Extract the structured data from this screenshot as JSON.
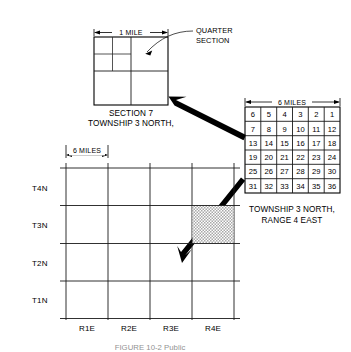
{
  "figure": {
    "caption": "FIGURE 10-2  Public"
  },
  "section_detail": {
    "dimension_label": "1 MILE",
    "caption_line1": "SECTION 7",
    "caption_line2": "TOWNSHIP 3 NORTH,",
    "callout_line1": "QUARTER",
    "callout_line2": "SECTION",
    "quadrants": 4,
    "subdivided_quadrant": "top-left"
  },
  "township_grid": {
    "dimension_label": "6 MILES",
    "caption_line1": "TOWNSHIP 3 NORTH,",
    "caption_line2": "RANGE 4 EAST",
    "columns": 6,
    "rows": 6,
    "sections": [
      [
        "6",
        "5",
        "4",
        "3",
        "2",
        "1"
      ],
      [
        "7",
        "8",
        "9",
        "10",
        "11",
        "12"
      ],
      [
        "13",
        "14",
        "15",
        "16",
        "17",
        "18"
      ],
      [
        "19",
        "20",
        "21",
        "22",
        "23",
        "24"
      ],
      [
        "25",
        "26",
        "27",
        "28",
        "29",
        "30"
      ],
      [
        "31",
        "32",
        "33",
        "34",
        "35",
        "36"
      ]
    ],
    "highlighted_section": "7"
  },
  "survey_grid": {
    "dimension_label": "6 MILES",
    "row_labels": [
      "T4N",
      "T3N",
      "T2N",
      "T1N"
    ],
    "column_labels": [
      "R1E",
      "R2E",
      "R3E",
      "R4E"
    ],
    "rows": 4,
    "columns": 4,
    "shaded_cell": {
      "row_label": "T3N",
      "column_label": "R4E"
    }
  },
  "colors": {
    "ink": "#000000",
    "line": "#1a1a1a",
    "shade": "#b9b9b9",
    "background": "#ffffff"
  }
}
